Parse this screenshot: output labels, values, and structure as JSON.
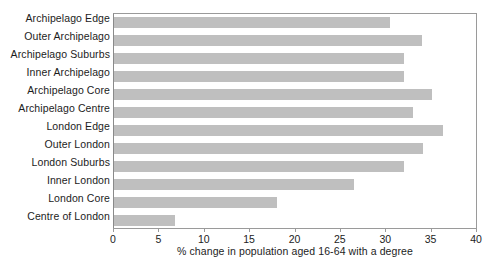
{
  "chart_data": {
    "type": "bar",
    "orientation": "horizontal",
    "title": "",
    "subtitle": "",
    "xlabel": "% change in population aged 16-64 with a degree",
    "ylabel": "",
    "xlim": [
      0,
      40
    ],
    "xticks": [
      0,
      5,
      10,
      15,
      20,
      25,
      30,
      35,
      40
    ],
    "xtick_labels": [
      "0",
      "5",
      "10",
      "15",
      "20",
      "25",
      "30",
      "35",
      "40"
    ],
    "grid": false,
    "legend": false,
    "bar_color": "#bfbfbf",
    "axis_color": "#9a9a9a",
    "categories": [
      "Archipelago Edge",
      "Outer Archipelago",
      "Archipelago Suburbs",
      "Inner Archipelago",
      "Archipelago Core",
      "Archipelago Centre",
      "London Edge",
      "Outer London",
      "London Suburbs",
      "Inner London",
      "London Core",
      "Centre of London"
    ],
    "values": [
      30.4,
      33.9,
      32.0,
      32.0,
      35.0,
      33.0,
      36.3,
      34.0,
      32.0,
      26.5,
      18.0,
      6.7
    ]
  }
}
